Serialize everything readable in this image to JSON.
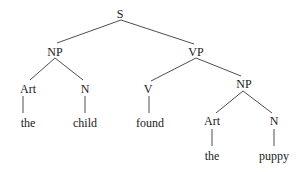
{
  "diagram": {
    "type": "syntax-tree",
    "colors": {
      "line": "#3a3a3a",
      "text": "#1a1a1a",
      "background": "#ffffff"
    },
    "nodes": [
      {
        "id": "S",
        "label": "S",
        "x": 120,
        "y": 18
      },
      {
        "id": "NP1",
        "label": "NP",
        "x": 55,
        "y": 56
      },
      {
        "id": "VP",
        "label": "VP",
        "x": 196,
        "y": 56
      },
      {
        "id": "Art1",
        "label": "Art",
        "x": 28,
        "y": 93
      },
      {
        "id": "N1",
        "label": "N",
        "x": 85,
        "y": 93
      },
      {
        "id": "V",
        "label": "V",
        "x": 148,
        "y": 93
      },
      {
        "id": "NP2",
        "label": "NP",
        "x": 244,
        "y": 88
      },
      {
        "id": "the1",
        "label": "the",
        "x": 28,
        "y": 127
      },
      {
        "id": "child",
        "label": "child",
        "x": 85,
        "y": 127
      },
      {
        "id": "found",
        "label": "found",
        "x": 150,
        "y": 127
      },
      {
        "id": "Art2",
        "label": "Art",
        "x": 212,
        "y": 125
      },
      {
        "id": "N2",
        "label": "N",
        "x": 274,
        "y": 125
      },
      {
        "id": "the2",
        "label": "the",
        "x": 212,
        "y": 160
      },
      {
        "id": "puppy",
        "label": "puppy",
        "x": 274,
        "y": 160
      }
    ],
    "edges": [
      {
        "from": "S",
        "to": "NP1",
        "x1": 121,
        "y1": 20,
        "x2": 57,
        "y2": 43
      },
      {
        "from": "S",
        "to": "VP",
        "x1": 121,
        "y1": 20,
        "x2": 194,
        "y2": 44
      },
      {
        "from": "NP1",
        "to": "Art1",
        "x1": 55,
        "y1": 58,
        "x2": 30,
        "y2": 80
      },
      {
        "from": "NP1",
        "to": "N1",
        "x1": 55,
        "y1": 58,
        "x2": 83,
        "y2": 80
      },
      {
        "from": "VP",
        "to": "V",
        "x1": 196,
        "y1": 58,
        "x2": 151,
        "y2": 81
      },
      {
        "from": "VP",
        "to": "NP2",
        "x1": 196,
        "y1": 58,
        "x2": 241,
        "y2": 76
      },
      {
        "from": "Art1",
        "to": "the1",
        "x1": 23,
        "y1": 96,
        "x2": 23,
        "y2": 113
      },
      {
        "from": "N1",
        "to": "child",
        "x1": 85,
        "y1": 96,
        "x2": 85,
        "y2": 113
      },
      {
        "from": "V",
        "to": "found",
        "x1": 149,
        "y1": 96,
        "x2": 149,
        "y2": 113
      },
      {
        "from": "NP2",
        "to": "Art2",
        "x1": 243,
        "y1": 91,
        "x2": 216,
        "y2": 113
      },
      {
        "from": "NP2",
        "to": "N2",
        "x1": 243,
        "y1": 91,
        "x2": 272,
        "y2": 113
      },
      {
        "from": "Art2",
        "to": "the2",
        "x1": 212,
        "y1": 129,
        "x2": 212,
        "y2": 146
      },
      {
        "from": "N2",
        "to": "puppy",
        "x1": 274,
        "y1": 129,
        "x2": 274,
        "y2": 146
      }
    ]
  }
}
